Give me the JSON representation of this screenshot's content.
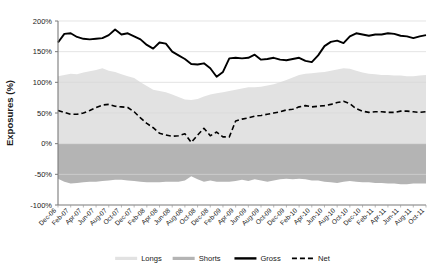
{
  "chart_data": {
    "type": "area",
    "title": "",
    "xlabel": "",
    "ylabel": "Exposures (%)",
    "ylim": [
      -100,
      200
    ],
    "yticks": [
      "-100%",
      "-50%",
      "0%",
      "50%",
      "100%",
      "150%",
      "200%"
    ],
    "ytick_values": [
      -100,
      -50,
      0,
      50,
      100,
      150,
      200
    ],
    "grid": true,
    "grid_axis": "y",
    "legend_position": "bottom",
    "categories": [
      "Dec-06",
      "Jan-07",
      "Feb-07",
      "Mar-07",
      "Apr-07",
      "May-07",
      "Jun-07",
      "Jul-07",
      "Aug-07",
      "Sep-07",
      "Oct-07",
      "Nov-07",
      "Dec-07",
      "Jan-08",
      "Feb-08",
      "Mar-08",
      "Apr-08",
      "May-08",
      "Jun-08",
      "Jul-08",
      "Aug-08",
      "Sep-08",
      "Oct-08",
      "Nov-08",
      "Dec-08",
      "Jan-09",
      "Feb-09",
      "Mar-09",
      "Apr-09",
      "May-09",
      "Jun-09",
      "Jul-09",
      "Aug-09",
      "Sep-09",
      "Oct-09",
      "Nov-09",
      "Dec-09",
      "Jan-10",
      "Feb-10",
      "Mar-10",
      "Apr-10",
      "May-10",
      "Jun-10",
      "Jul-10",
      "Aug-10",
      "Sep-10",
      "Oct-10",
      "Nov-10",
      "Dec-10",
      "Jan-11",
      "Feb-11",
      "Mar-11",
      "Apr-11",
      "May-11",
      "Jun-11",
      "Jul-11",
      "Aug-11",
      "Sep-11",
      "Oct-11"
    ],
    "xtick_labels": [
      "Dec-06",
      "Feb-07",
      "Apr-07",
      "Jun-07",
      "Aug-07",
      "Oct-07",
      "Dec-07",
      "Feb-08",
      "Apr-08",
      "Jun-08",
      "Aug-08",
      "Oct-08",
      "Dec-08",
      "Feb-09",
      "Apr-09",
      "Jun-09",
      "Aug-09",
      "Oct-09",
      "Dec-09",
      "Feb-10",
      "Apr-10",
      "Jun-10",
      "Aug-10",
      "Oct-10",
      "Dec-10",
      "Feb-11",
      "Apr-11",
      "Jun-11",
      "Aug-11",
      "Oct-11"
    ],
    "xtick_rotation": -45,
    "series": [
      {
        "name": "Longs",
        "type": "area",
        "color": "#e2e2e2",
        "values": [
          110,
          112,
          114,
          113,
          116,
          118,
          120,
          123,
          119,
          117,
          113,
          110,
          107,
          100,
          94,
          88,
          86,
          84,
          80,
          76,
          72,
          71,
          73,
          77,
          80,
          82,
          84,
          86,
          88,
          90,
          92,
          92,
          93,
          95,
          97,
          100,
          104,
          108,
          112,
          114,
          115,
          116,
          117,
          119,
          121,
          123,
          122,
          119,
          116,
          114,
          113,
          112,
          112,
          111,
          111,
          110,
          110,
          111,
          112
        ]
      },
      {
        "name": "Shorts",
        "type": "area",
        "color": "#b4b4b4",
        "values": [
          -57,
          -62,
          -65,
          -64,
          -63,
          -62,
          -62,
          -61,
          -60,
          -59,
          -59,
          -60,
          -61,
          -62,
          -63,
          -63,
          -63,
          -62,
          -62,
          -62,
          -60,
          -53,
          -58,
          -62,
          -60,
          -62,
          -62,
          -62,
          -61,
          -59,
          -61,
          -58,
          -60,
          -62,
          -60,
          -58,
          -57,
          -58,
          -57,
          -58,
          -60,
          -60,
          -62,
          -63,
          -64,
          -62,
          -61,
          -62,
          -63,
          -63,
          -64,
          -64,
          -65,
          -65,
          -66,
          -66,
          -65,
          -65,
          -65
        ]
      },
      {
        "name": "Gross",
        "type": "line",
        "style": "solid",
        "color": "#000000",
        "values": [
          165,
          179,
          180,
          174,
          171,
          170,
          171,
          172,
          177,
          186,
          178,
          180,
          175,
          170,
          161,
          155,
          165,
          163,
          150,
          144,
          138,
          130,
          129,
          131,
          123,
          109,
          117,
          139,
          140,
          139,
          140,
          145,
          137,
          138,
          140,
          137,
          136,
          138,
          140,
          135,
          133,
          144,
          159,
          166,
          168,
          164,
          175,
          180,
          178,
          176,
          178,
          178,
          180,
          179,
          176,
          175,
          172,
          175,
          177
        ]
      },
      {
        "name": "Net",
        "type": "line",
        "style": "dashed",
        "color": "#000000",
        "values": [
          54,
          51,
          48,
          48,
          50,
          54,
          59,
          63,
          64,
          61,
          60,
          59,
          52,
          42,
          33,
          26,
          17,
          14,
          12,
          13,
          16,
          2,
          14,
          25,
          13,
          19,
          11,
          11,
          37,
          40,
          42,
          45,
          46,
          48,
          50,
          52,
          55,
          56,
          60,
          62,
          60,
          61,
          62,
          64,
          67,
          69,
          65,
          57,
          53,
          51,
          52,
          52,
          51,
          51,
          53,
          53,
          52,
          51,
          52
        ]
      }
    ],
    "legend": [
      {
        "label": "Longs",
        "color": "#e2e2e2",
        "marker": "area-swatch"
      },
      {
        "label": "Shorts",
        "color": "#b4b4b4",
        "marker": "area-swatch"
      },
      {
        "label": "Gross",
        "color": "#000000",
        "marker": "solid-line"
      },
      {
        "label": "Net",
        "color": "#000000",
        "marker": "dashed-line"
      }
    ]
  }
}
